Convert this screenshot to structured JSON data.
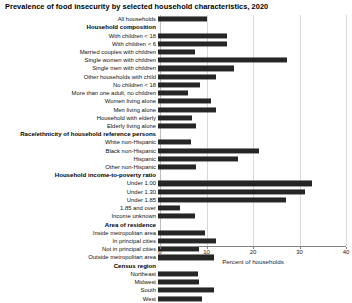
{
  "chart_data": {
    "type": "bar",
    "orientation": "horizontal",
    "title": "Prevalence of food insecurity by selected household characteristics, 2020",
    "xlabel": "Percent of households",
    "ylabel": "",
    "xlim": [
      0,
      40
    ],
    "xticks": [
      0,
      10,
      20,
      30,
      40
    ],
    "xtick_labels": [
      "0",
      "10",
      "20",
      "30",
      "40"
    ],
    "grid": true,
    "legend": "none",
    "bar_color": "#262626",
    "categories": [
      "All households",
      "Household composition",
      "With children < 18",
      "With children < 6",
      "Married couples with children",
      "Single women with children",
      "Single men with children",
      "Other households with child",
      "No children < 18",
      "More than one adult, no children",
      "Women living alone",
      "Men living alone",
      "Household with elderly",
      "Elderly living alone",
      "Race/ethnicity of household reference persons",
      "White non-Hispanic",
      "Black non-Hispanic",
      "Hispanic",
      "Other non-Hispanic",
      "Household income-to-poverty ratio",
      "Under 1.00",
      "Under 1.30",
      "Under 1.85",
      "1.85 and over",
      "Income unknown",
      "Area of residence",
      "Inside metropolitan area",
      "In principal cities",
      "Not in principal cities",
      "Outside metropolitan area",
      "Census region",
      "Northeast",
      "Midwest",
      "South",
      "West"
    ],
    "values": [
      10.5,
      null,
      14.8,
      14.8,
      7.9,
      27.7,
      16.3,
      12.4,
      9.0,
      6.5,
      11.5,
      12.4,
      7.4,
      8.1,
      null,
      7.1,
      21.7,
      17.2,
      8.1,
      null,
      33.1,
      31.6,
      27.5,
      4.8,
      7.9,
      null,
      10.2,
      12.4,
      8.9,
      12.1,
      null,
      8.7,
      8.9,
      12.1,
      9.4
    ],
    "headers": [
      "Household composition",
      "Race/ethnicity of household reference persons",
      "Household income-to-poverty ratio",
      "Area of residence",
      "Census region"
    ]
  }
}
